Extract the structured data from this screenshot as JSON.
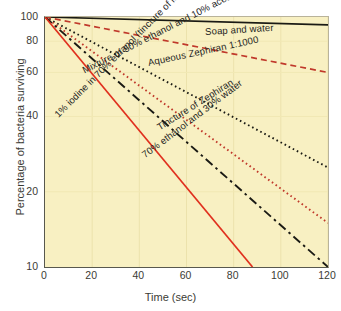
{
  "chart_data": {
    "type": "line",
    "title": "",
    "xlabel": "Time (sec)",
    "ylabel": "Percentage of bacteria surviving",
    "xlim": [
      0,
      120
    ],
    "ylim": [
      10,
      100
    ],
    "yscale": "log",
    "grid": true,
    "legend_position": "inline-curve-labels",
    "background_color": "#f8f0c2",
    "xticks": [
      "0",
      "20",
      "40",
      "60",
      "80",
      "100",
      "120"
    ],
    "xtick_values": [
      0,
      20,
      40,
      60,
      80,
      100,
      120
    ],
    "yticks": [
      "100",
      "80",
      "60",
      "40",
      "20",
      "10"
    ],
    "ytick_values": [
      100,
      80,
      60,
      40,
      20,
      10
    ],
    "series": [
      {
        "name": "Soap and water",
        "label": "Soap and water",
        "color": "#1a1a14",
        "style": "solid",
        "x": [
          0,
          120
        ],
        "values": [
          100,
          93
        ],
        "label_x": 205,
        "label_y": 26,
        "label_rotation": -3.5
      },
      {
        "name": "Aqueous Zephiran 1:1000",
        "label": "Aqueous Zephiran 1:1000",
        "color": "#c0392b",
        "style": "dashed",
        "x": [
          0,
          120
        ],
        "values": [
          100,
          60
        ],
        "label_x": 148,
        "label_y": 57,
        "label_rotation": -12
      },
      {
        "name": "Mixture of 50% ethanol and 10% acetone",
        "label": "Mixture of 50% ethanol and 10% acetone",
        "color": "#1a1a14",
        "style": "dotted",
        "x": [
          0,
          120
        ],
        "values": [
          100,
          25
        ],
        "label_x": 83,
        "label_y": 65,
        "label_rotation": -27
      },
      {
        "name": "Tincture of Zephiran",
        "label": "Tincture of Zephiran",
        "color": "#c0392b",
        "style": "dotted",
        "x": [
          0,
          120
        ],
        "values": [
          100,
          15
        ],
        "label_x": 158,
        "label_y": 122,
        "label_rotation": -32
      },
      {
        "name": "70% ethanol and 30% water",
        "label": "70% ethanol and 30% water",
        "color": "#1a1a14",
        "style": "dashdot",
        "x": [
          0,
          120
        ],
        "values": [
          100,
          10
        ],
        "label_x": 143,
        "label_y": 150,
        "label_rotation": -37
      },
      {
        "name": "1% iodine in 70% ethanol (tincture of iodine)",
        "label": "1% iodine in 70% ethanol (tincture of iodine)",
        "color": "#e0301e",
        "style": "solid",
        "x": [
          0,
          88
        ],
        "values": [
          100,
          10
        ],
        "label_x": 56,
        "label_y": 110,
        "label_rotation": -45
      }
    ]
  }
}
